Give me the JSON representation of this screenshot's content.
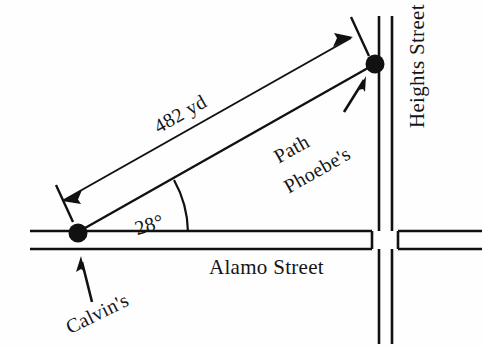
{
  "diagram": {
    "kind": "trigonometry-street-map",
    "labels": {
      "alamo_street": "Alamo Street",
      "heights_street": "Heights Street",
      "distance": "482 yd",
      "path": "Path",
      "phoebes": "Phoebe's",
      "calvins": "Calvin's",
      "angle": "28°"
    },
    "values": {
      "distance_magnitude": "482",
      "distance_unit": "yd",
      "angle_degrees": "28"
    },
    "points": [
      {
        "name": "calvins-house",
        "x": 78,
        "y": 232,
        "label": "Calvin's"
      },
      {
        "name": "phoebes-house",
        "x": 375,
        "y": 64,
        "label": "Phoebe's"
      }
    ],
    "colors": {
      "ink": "#111111",
      "paper": "#fefefe"
    },
    "streets": [
      {
        "name": "alamo-street",
        "orientation": "horizontal",
        "label": "Alamo Street"
      },
      {
        "name": "heights-street",
        "orientation": "vertical",
        "label": "Heights Street"
      }
    ]
  }
}
